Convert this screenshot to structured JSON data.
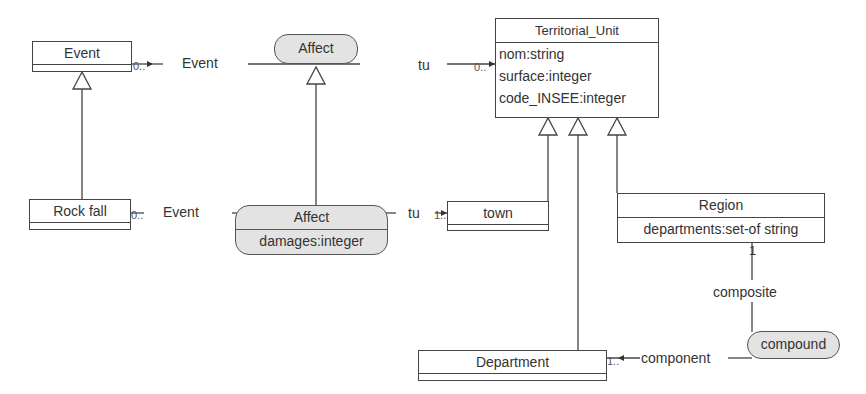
{
  "diagram": {
    "type": "UML class diagram",
    "classes": [
      {
        "id": "event",
        "name": "Event",
        "attributes": []
      },
      {
        "id": "rockfall",
        "name": "Rock fall",
        "attributes": []
      },
      {
        "id": "territorial_unit",
        "name": "Territorial_Unit",
        "attributes": [
          "nom:string",
          "surface:integer",
          "code_INSEE:integer"
        ]
      },
      {
        "id": "town",
        "name": "town",
        "attributes": []
      },
      {
        "id": "region",
        "name": "Region",
        "attributes": [
          "departments:set-of string"
        ]
      },
      {
        "id": "department",
        "name": "Department",
        "attributes": []
      }
    ],
    "associations": [
      {
        "id": "affect_top",
        "name": "Affect",
        "attributes": [],
        "role_left": "Event",
        "role_right": "tu",
        "mult_left": "0..*",
        "mult_right": "0..*"
      },
      {
        "id": "affect_bottom",
        "name": "Affect",
        "attributes": [
          "damages:integer"
        ],
        "role_left": "Event",
        "role_right": "tu",
        "mult_left": "0..",
        "mult_right": "1..*"
      },
      {
        "id": "compound",
        "name": "compound",
        "attributes": [],
        "role_top": "composite",
        "role_left": "component",
        "mult_top": "1",
        "mult_left": "1..*"
      }
    ],
    "generalizations": [
      {
        "child": "Rock fall",
        "parent": "Event"
      },
      {
        "child": "Affect (damages)",
        "parent": "Affect"
      },
      {
        "child": "town",
        "parent": "Territorial_Unit"
      },
      {
        "child": "Department",
        "parent": "Territorial_Unit"
      },
      {
        "child": "Region",
        "parent": "Territorial_Unit"
      }
    ]
  },
  "labels": {
    "event_title": "Event",
    "rockfall_title": "Rock fall",
    "tu_title": "Territorial_Unit",
    "tu_attr_0": "nom:string",
    "tu_attr_1": "surface:integer",
    "tu_attr_2": "code_INSEE:integer",
    "town_title": "town",
    "region_title": "Region",
    "region_attr_0": "departments:set-of string",
    "department_title": "Department",
    "affect_top_name": "Affect",
    "affect_bottom_name": "Affect",
    "affect_bottom_attr": "damages:integer",
    "compound_name": "compound",
    "role_event_top": "Event",
    "role_tu_top": "tu",
    "role_event_bottom": "Event",
    "role_tu_bottom": "tu",
    "role_composite": "composite",
    "role_component": "component",
    "mult_event_top": "0..",
    "mult_tu_top": "0..",
    "mult_event_bottom": "0..",
    "mult_tu_bottom": "1..",
    "mult_composite": "1",
    "mult_component": "1.."
  }
}
